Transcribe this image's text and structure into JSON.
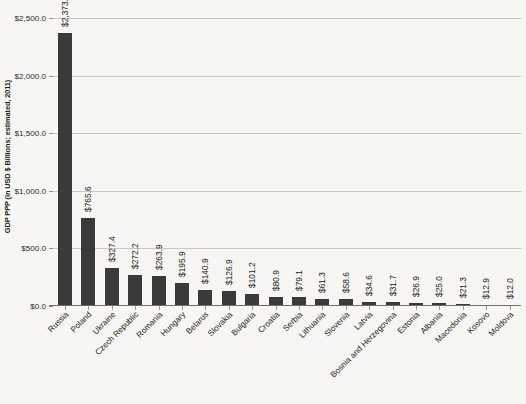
{
  "chart_data": {
    "type": "bar",
    "title": "",
    "xlabel": "",
    "ylabel": "GDP PPP (in USD $ Billions; estimated, 2011)",
    "ylim": [
      0,
      2500
    ],
    "grid": true,
    "legend": "none",
    "orientation": "vertical",
    "bar_color": "#3a3a3a",
    "y_ticks": [
      0,
      500,
      1000,
      1500,
      2000,
      2500
    ],
    "y_tick_labels": [
      "$0.0",
      "$500.0",
      "$1,000.0",
      "$1,500.0",
      "$2,000.0",
      "$2,500.0"
    ],
    "categories": [
      "Russia",
      "Poland",
      "Ukraine",
      "Czech Republic",
      "Romania",
      "Hungary",
      "Belarus",
      "Slovakia",
      "Bulgaria",
      "Croatia",
      "Serbia",
      "Lithuania",
      "Slovenia",
      "Latvia",
      "Bosnia and Herzegovina",
      "Estonia",
      "Albania",
      "Macedonia",
      "Kosovo",
      "Moldova"
    ],
    "values": [
      2373.0,
      765.6,
      327.4,
      272.2,
      263.9,
      195.9,
      140.9,
      126.9,
      101.2,
      80.9,
      79.1,
      61.3,
      58.6,
      34.6,
      31.7,
      26.9,
      25.0,
      21.3,
      12.9,
      12.0
    ],
    "value_labels": [
      "$2,373.0",
      "$765.6",
      "$327.4",
      "$272.2",
      "$263.9",
      "$195.9",
      "$140.9",
      "$126.9",
      "$101.2",
      "$80.9",
      "$79.1",
      "$61.3",
      "$58.6",
      "$34.6",
      "$31.7",
      "$26.9",
      "$25.0",
      "$21.3",
      "$12.9",
      "$12.0"
    ]
  }
}
